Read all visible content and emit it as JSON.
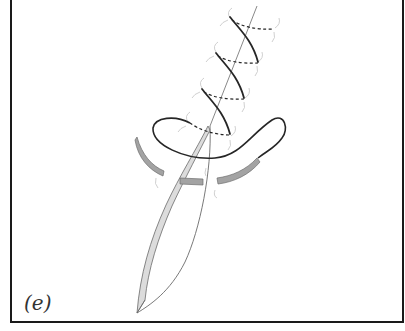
{
  "figure": {
    "panel_label": "(e)",
    "colors": {
      "frame": "#1a1a1a",
      "suture": "#2a2a2a",
      "blade_outline": "#6a6a6a",
      "blade_fill": "#d9d9d9",
      "arrow_fill": "#9a9a9a",
      "arrow_outline": "#6a6a6a",
      "fiber": "#bfbfbf"
    },
    "elements": {
      "coils_count": 4,
      "arrows": [
        "left-arrow",
        "center-arrow",
        "right-arrow"
      ]
    }
  }
}
